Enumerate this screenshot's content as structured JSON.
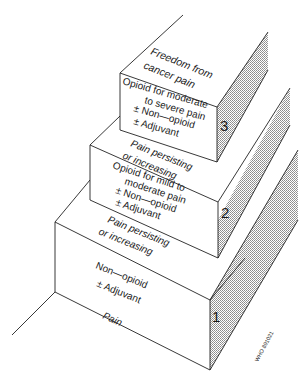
{
  "diagram": {
    "colors": {
      "line": "#222222",
      "shade": "#bdbdbd",
      "background": "#ffffff"
    },
    "steps": [
      {
        "number": "1",
        "label_lines": [
          "Non—opioid",
          "± Adjuvant"
        ],
        "below": "Pain"
      },
      {
        "number": "2",
        "label_lines": [
          "Opioid for mild to",
          "moderate pain",
          "± Non—opioid",
          "± Adjuvant"
        ],
        "below_lines": [
          "Pain persisting",
          "or increasing"
        ]
      },
      {
        "number": "3",
        "label_lines": [
          "Opioid for moderate",
          "to severe pain",
          "± Non—opioid",
          "± Adjuvant"
        ],
        "below_lines": [
          "Pain persisting",
          "or increasing"
        ]
      }
    ],
    "top": {
      "lines": [
        "Freedom from",
        "cancer pain"
      ]
    },
    "credit": "WHO 891021"
  }
}
